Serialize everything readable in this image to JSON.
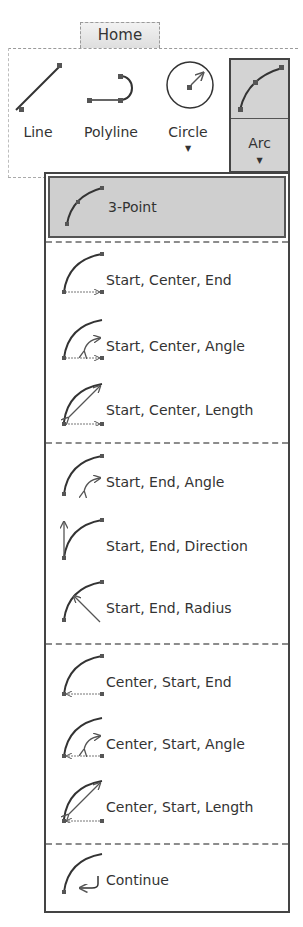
{
  "ribbon": {
    "tab_label": "Home",
    "tools": [
      {
        "label": "Line",
        "icon": "line-icon",
        "has_dropdown": false
      },
      {
        "label": "Polyline",
        "icon": "polyline-icon",
        "has_dropdown": false
      },
      {
        "label": "Circle",
        "icon": "circle-icon",
        "has_dropdown": true
      },
      {
        "label": "Arc",
        "icon": "arc-icon",
        "has_dropdown": true,
        "state": "expanded"
      }
    ],
    "caret_glyph": "▼"
  },
  "arc_menu": {
    "groups": [
      {
        "items": [
          {
            "label": "3-Point",
            "icon": "arc-3-point-icon",
            "highlighted": true
          }
        ]
      },
      {
        "items": [
          {
            "label": "Start, Center, End",
            "icon": "arc-start-center-end-icon"
          },
          {
            "label": "Start, Center, Angle",
            "icon": "arc-start-center-angle-icon"
          },
          {
            "label": "Start, Center, Length",
            "icon": "arc-start-center-length-icon"
          }
        ]
      },
      {
        "items": [
          {
            "label": "Start, End, Angle",
            "icon": "arc-start-end-angle-icon"
          },
          {
            "label": "Start, End, Direction",
            "icon": "arc-start-end-direction-icon"
          },
          {
            "label": "Start, End, Radius",
            "icon": "arc-start-end-radius-icon"
          }
        ]
      },
      {
        "items": [
          {
            "label": "Center, Start, End",
            "icon": "arc-center-start-end-icon"
          },
          {
            "label": "Center, Start, Angle",
            "icon": "arc-center-start-angle-icon"
          },
          {
            "label": "Center, Start, Length",
            "icon": "arc-center-start-length-icon"
          }
        ]
      },
      {
        "items": [
          {
            "label": "Continue",
            "icon": "arc-continue-icon"
          }
        ]
      }
    ]
  }
}
